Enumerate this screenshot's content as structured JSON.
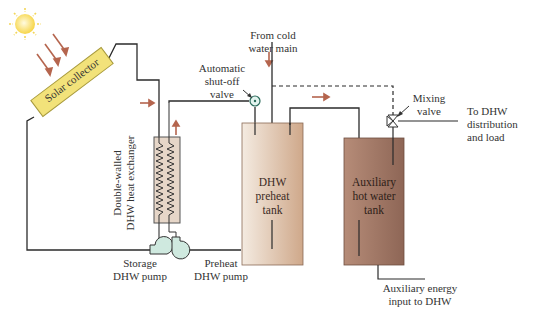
{
  "colors": {
    "pipe": "#2b2b2b",
    "flow_arrow": "#b5654e",
    "collector_fill": "#f2e27a",
    "collector_stroke": "#a89a3c",
    "sun": "#f6d23a",
    "preheat_tank": "#dcc0a6",
    "aux_tank": "#a67d6c",
    "pump_fill": "#cfe9df",
    "hx_fill": "#e6d6c8"
  },
  "components": {
    "solar_collector": {
      "label": "Solar collector"
    },
    "heat_exchanger": {
      "label_line1": "Double-walled",
      "label_line2": "DHW heat exchanger"
    },
    "storage_pump": {
      "label_line1": "Storage",
      "label_line2": "DHW pump"
    },
    "preheat_pump": {
      "label_line1": "Preheat",
      "label_line2": "DHW pump"
    },
    "shutoff_valve": {
      "label_line1": "Automatic",
      "label_line2": "shut-off",
      "label_line3": "valve"
    },
    "cold_water": {
      "label_line1": "From cold",
      "label_line2": "water main"
    },
    "preheat_tank": {
      "label_line1": "DHW",
      "label_line2": "preheat",
      "label_line3": "tank"
    },
    "aux_tank": {
      "label_line1": "Auxiliary",
      "label_line2": "hot water",
      "label_line3": "tank"
    },
    "mixing_valve": {
      "label_line1": "Mixing",
      "label_line2": "valve"
    },
    "distribution": {
      "label_line1": "To DHW",
      "label_line2": "distribution",
      "label_line3": "and load"
    },
    "aux_energy": {
      "label_line1": "Auxiliary energy",
      "label_line2": "input to DHW"
    }
  }
}
